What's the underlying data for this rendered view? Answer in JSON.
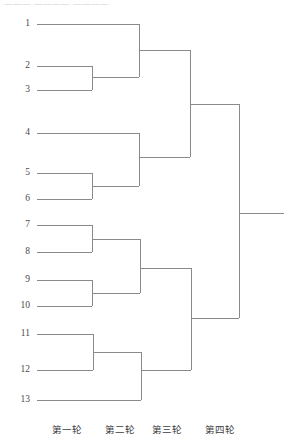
{
  "diagram": {
    "type": "tournament-bracket",
    "seed_count": 13,
    "round_count": 4,
    "line_color": "#8a8a8a",
    "background_color": "#ffffff",
    "text_color": "#3c3c3c"
  },
  "top_remnant": {
    "text": "———   ————   ————"
  },
  "seeds": [
    {
      "label": "1",
      "x": 30,
      "y": 24,
      "line_start_x": 37,
      "line_end_x": 139
    },
    {
      "label": "2",
      "x": 30,
      "y": 66,
      "line_start_x": 37,
      "line_end_x": 92
    },
    {
      "label": "3",
      "x": 30,
      "y": 90,
      "line_start_x": 37,
      "line_end_x": 92
    },
    {
      "label": "4",
      "x": 30,
      "y": 133,
      "line_start_x": 37,
      "line_end_x": 139
    },
    {
      "label": "5",
      "x": 30,
      "y": 173,
      "line_start_x": 37,
      "line_end_x": 92
    },
    {
      "label": "6",
      "x": 30,
      "y": 199,
      "line_start_x": 37,
      "line_end_x": 92
    },
    {
      "label": "7",
      "x": 30,
      "y": 225,
      "line_start_x": 37,
      "line_end_x": 92
    },
    {
      "label": "8",
      "x": 30,
      "y": 252,
      "line_start_x": 37,
      "line_end_x": 92
    },
    {
      "label": "9",
      "x": 30,
      "y": 280,
      "line_start_x": 37,
      "line_end_x": 92
    },
    {
      "label": "10",
      "x": 30,
      "y": 306,
      "line_start_x": 37,
      "line_end_x": 92
    },
    {
      "label": "11",
      "x": 30,
      "y": 334,
      "line_start_x": 37,
      "line_end_x": 93
    },
    {
      "label": "12",
      "x": 30,
      "y": 370,
      "line_start_x": 37,
      "line_end_x": 93
    },
    {
      "label": "13",
      "x": 30,
      "y": 400,
      "line_start_x": 37,
      "line_end_x": 141
    }
  ],
  "connectors": [
    {
      "name": "r1-match-2v3",
      "x": 92,
      "y_top": 66,
      "y_bottom": 90,
      "out_y": 77,
      "out_x": 139
    },
    {
      "name": "r1-match-5v6",
      "x": 92,
      "y_top": 173,
      "y_bottom": 199,
      "out_y": 186,
      "out_x": 139
    },
    {
      "name": "r1-match-7v8",
      "x": 92,
      "y_top": 225,
      "y_bottom": 252,
      "out_y": 239,
      "out_x": 140
    },
    {
      "name": "r1-match-9v10",
      "x": 92,
      "y_top": 280,
      "y_bottom": 306,
      "out_y": 293,
      "out_x": 140
    },
    {
      "name": "r1-match-11v12",
      "x": 93,
      "y_top": 334,
      "y_bottom": 370,
      "out_y": 352,
      "out_x": 141
    },
    {
      "name": "r2-match-upper1",
      "x": 139,
      "y_top": 24,
      "y_bottom": 77,
      "out_y": 50,
      "out_x": 190
    },
    {
      "name": "r2-match-upper2",
      "x": 139,
      "y_top": 133,
      "y_bottom": 186,
      "out_y": 157,
      "out_x": 190
    },
    {
      "name": "r2-match-lower1",
      "x": 140,
      "y_top": 239,
      "y_bottom": 293,
      "out_y": 268,
      "out_x": 191
    },
    {
      "name": "r2-match-lower2",
      "x": 141,
      "y_top": 352,
      "y_bottom": 400,
      "out_y": 370,
      "out_x": 191
    },
    {
      "name": "r3-semifinal-top",
      "x": 190,
      "y_top": 50,
      "y_bottom": 157,
      "out_y": 104,
      "out_x": 239
    },
    {
      "name": "r3-semifinal-bot",
      "x": 191,
      "y_top": 268,
      "y_bottom": 370,
      "out_y": 318,
      "out_x": 239
    },
    {
      "name": "r4-final",
      "x": 239,
      "y_top": 104,
      "y_bottom": 318,
      "out_y": 213,
      "out_x": 284
    }
  ],
  "round_labels": [
    {
      "text": "第一轮",
      "x": 52,
      "y": 424
    },
    {
      "text": "第二轮",
      "x": 105,
      "y": 424
    },
    {
      "text": "第三轮",
      "x": 152,
      "y": 424
    },
    {
      "text": "第四轮",
      "x": 205,
      "y": 424
    }
  ]
}
